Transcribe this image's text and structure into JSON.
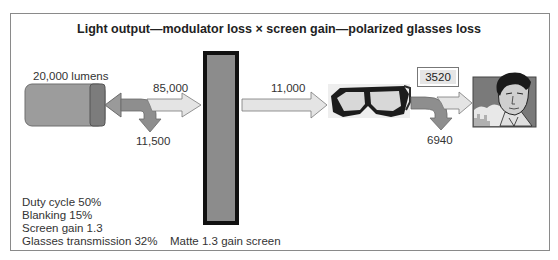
{
  "title": "Light output—modulator loss × screen gain—polarized glasses loss",
  "projector": {
    "label": "20,000 lumens",
    "icon": "projector-icon"
  },
  "flows": {
    "projector_to_screen": "85,000",
    "modulator_loss": "11,500",
    "screen_to_glasses": "11,000",
    "glasses_to_viewer": "3520",
    "glasses_loss": "6940"
  },
  "screen": {
    "label": "Matte 1.3 gain screen",
    "icon": "screen-icon"
  },
  "glasses": {
    "icon": "polarized-glasses-icon"
  },
  "viewer": {
    "icon": "viewer-face-icon"
  },
  "notes": [
    "Duty cycle 50%",
    "Blanking 15%",
    "Screen gain 1.3",
    "Glasses transmission 32%"
  ],
  "colors": {
    "frame": "#8a8a8a",
    "projector_body": "#9a9a9a",
    "projector_lens": "#7a7a7a",
    "arrow_light": "#e4e4e4",
    "arrow_loss": "#8e8e8e",
    "screen_fill": "#8c8c8c",
    "screen_border": "#111111"
  }
}
